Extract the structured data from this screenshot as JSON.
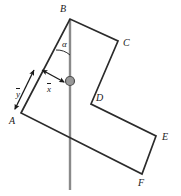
{
  "figure": {
    "background_color": "#ffffff",
    "outline_color": "#2b2b2b",
    "axis_line_color": "#8a8a8a",
    "pivot_fill_color": "#999999",
    "pivot_stroke_color": "#4d4d4d",
    "vector_color": "#1a1a1a",
    "label_color": "#1a1a1a",
    "vertices": [
      {
        "name": "A",
        "label": "A",
        "x": 21,
        "y": 113,
        "label_x": 9,
        "label_y": 116
      },
      {
        "name": "B",
        "label": "B",
        "x": 70,
        "y": 19,
        "label_x": 60,
        "label_y": 4
      },
      {
        "name": "C",
        "label": "C",
        "x": 118,
        "y": 41,
        "label_x": 123,
        "label_y": 38
      },
      {
        "name": "D",
        "label": "D",
        "x": 91,
        "y": 104,
        "label_x": 96,
        "label_y": 93
      },
      {
        "name": "E",
        "label": "E",
        "x": 156,
        "y": 136,
        "label_x": 162,
        "label_y": 132
      },
      {
        "name": "F",
        "label": "F",
        "x": 142,
        "y": 174,
        "label_x": 138,
        "label_y": 178
      }
    ],
    "outline_path": "M 21 113 L 70 19 L 118 41 L 91 104 L 156 136 L 142 174 L 21 113 Z",
    "vertical_axis": {
      "x": 70,
      "y_top": 19,
      "y_bottom": 190
    },
    "pivot": {
      "x": 70,
      "y": 81,
      "radius": 4.5
    },
    "angle": {
      "symbol": "α",
      "label_x": 62,
      "label_y": 40,
      "arc_path": "M 70 55 A 20 20 0 0 0 56 50"
    },
    "vectors": [
      {
        "name": "x-bar",
        "symbol": "x",
        "from_x": 64,
        "from_y": 82,
        "to_x": 42,
        "to_y": 70,
        "label_x": 47,
        "label_y": 83
      },
      {
        "name": "y-bar",
        "symbol": "y",
        "from_x": 15,
        "from_y": 109,
        "to_x": 34,
        "to_y": 70,
        "label_x": 16,
        "label_y": 88
      }
    ]
  }
}
